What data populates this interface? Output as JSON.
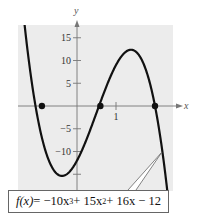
{
  "chart_data": {
    "type": "line",
    "title": "",
    "xlabel": "x",
    "ylabel": "y",
    "function": "f(x) = -10x^3 + 15x^2 + 16x - 12",
    "xlim": [
      -1.5,
      2.4
    ],
    "ylim": [
      -18.5,
      18
    ],
    "x_ticks": [
      1
    ],
    "x_tick_labels": [
      "1"
    ],
    "y_ticks": [
      15,
      10,
      5,
      -5,
      -10,
      -15
    ],
    "y_tick_labels": [
      "15",
      "10",
      "5",
      "−5",
      "−10",
      ""
    ],
    "grid": false,
    "background": "#ececec",
    "line_color": "#111111",
    "zeros": [
      {
        "x": -0.9,
        "y": 0
      },
      {
        "x": 0.6,
        "y": 0
      },
      {
        "x": 2.0,
        "y": 0
      }
    ],
    "local_min": {
      "x": -0.4,
      "y": -15.7
    },
    "local_max": {
      "x": 1.4,
      "y": 12.3
    },
    "series": [
      {
        "name": "f(x)",
        "x": [
          -1.1,
          -1.0,
          -0.9,
          -0.8,
          -0.6,
          -0.4,
          -0.2,
          0.0,
          0.2,
          0.4,
          0.6,
          0.8,
          1.0,
          1.2,
          1.4,
          1.6,
          1.8,
          2.0,
          2.2,
          2.35
        ],
        "values": [
          21.2,
          9.0,
          -0.96,
          -8.0,
          -15.5,
          -15.7,
          -14.6,
          -12.0,
          -8.3,
          -3.9,
          0.64,
          4.8,
          9.0,
          11.5,
          12.3,
          11.0,
          7.3,
          0.0,
          -11.1,
          -22.0
        ]
      }
    ],
    "annotations": [
      {
        "text": "f(x) = −10x³ + 15x² + 16x − 12",
        "points_to": "curve near x ≈ 2.2"
      }
    ]
  },
  "labels": {
    "y_axis": "y",
    "x_axis": "x",
    "equation_fx": "f(x)",
    "equation_rest": " = −10x",
    "eq_exp1": "3",
    "eq_mid": " + 15x",
    "eq_exp2": "2",
    "eq_tail": " + 16x − 12"
  }
}
